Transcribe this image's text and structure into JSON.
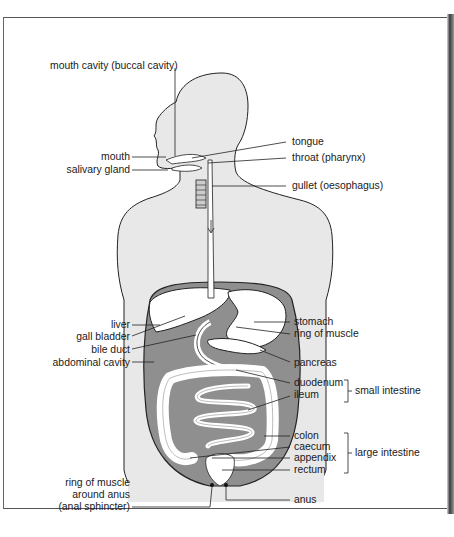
{
  "diagram": {
    "colors": {
      "body_fill": "#e8e8e8",
      "cavity_fill": "#8f8f8f",
      "organ_fill": "#ffffff",
      "outline": "#222222",
      "text": "#1a1a1a"
    },
    "labels_left": [
      {
        "id": "mouth-cavity",
        "text": "mouth cavity (buccal cavity)"
      },
      {
        "id": "mouth",
        "text": "mouth"
      },
      {
        "id": "salivary-gland",
        "text": "salivary gland"
      },
      {
        "id": "liver",
        "text": "liver"
      },
      {
        "id": "gall-bladder",
        "text": "gall bladder"
      },
      {
        "id": "bile-duct",
        "text": "bile duct"
      },
      {
        "id": "abdominal-cavity",
        "text": "abdominal cavity"
      },
      {
        "id": "anal-sphincter-1",
        "text": "ring of muscle"
      },
      {
        "id": "anal-sphincter-2",
        "text": "around anus"
      },
      {
        "id": "anal-sphincter-3",
        "text": "(anal sphincter)"
      }
    ],
    "labels_right": [
      {
        "id": "tongue",
        "text": "tongue"
      },
      {
        "id": "throat",
        "text": "throat (pharynx)"
      },
      {
        "id": "gullet",
        "text": "gullet (oesophagus)"
      },
      {
        "id": "stomach",
        "text": "stomach"
      },
      {
        "id": "ring-of-muscle",
        "text": "ring of muscle"
      },
      {
        "id": "pancreas",
        "text": "pancreas"
      },
      {
        "id": "duodenum",
        "text": "duodenum"
      },
      {
        "id": "ileum",
        "text": "ileum"
      },
      {
        "id": "colon",
        "text": "colon"
      },
      {
        "id": "caecum",
        "text": "caecum"
      },
      {
        "id": "appendix",
        "text": "appendix"
      },
      {
        "id": "rectum",
        "text": "rectum"
      },
      {
        "id": "anus",
        "text": "anus"
      }
    ],
    "groups": [
      {
        "id": "small-intestine",
        "text": "small intestine",
        "members": [
          "duodenum",
          "ileum"
        ]
      },
      {
        "id": "large-intestine",
        "text": "large intestine",
        "members": [
          "colon",
          "caecum",
          "appendix",
          "rectum"
        ]
      }
    ]
  }
}
